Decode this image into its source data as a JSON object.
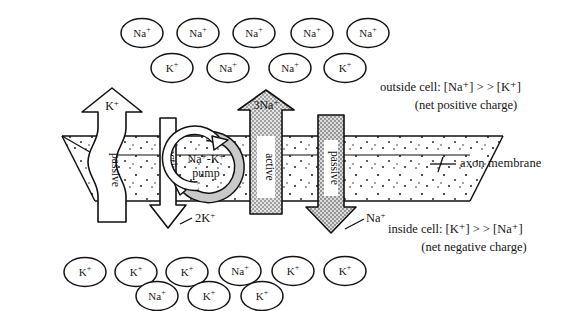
{
  "diagram": {
    "colors": {
      "stroke": "#111111",
      "membrane_fill": "#ffffff",
      "stipple": "#1a1a1a",
      "gray_arrow_fill": "#bdbdbd",
      "white_arrow_fill": "#ffffff",
      "text": "#141414"
    }
  },
  "outside": {
    "ions_row1": [
      {
        "label": "Na",
        "charge": "+",
        "x": 142,
        "y": 33
      },
      {
        "label": "Na",
        "charge": "+",
        "x": 198,
        "y": 33
      },
      {
        "label": "Na",
        "charge": "+",
        "x": 254,
        "y": 33
      },
      {
        "label": "Na",
        "charge": "+",
        "x": 312,
        "y": 33
      },
      {
        "label": "Na",
        "charge": "+",
        "x": 368,
        "y": 33
      }
    ],
    "ions_row2": [
      {
        "label": "K",
        "charge": "+",
        "x": 172,
        "y": 68
      },
      {
        "label": "Na",
        "charge": "+",
        "x": 228,
        "y": 68
      },
      {
        "label": "Na",
        "charge": "+",
        "x": 290,
        "y": 68
      },
      {
        "label": "K",
        "charge": "+",
        "x": 345,
        "y": 68
      }
    ],
    "caption_line1": "outside cell: [Na⁺] > > [K⁺]",
    "caption_line2": "(net positive charge)"
  },
  "inside": {
    "ions_row1": [
      {
        "label": "K",
        "charge": "+",
        "x": 85,
        "y": 272
      },
      {
        "label": "K",
        "charge": "+",
        "x": 136,
        "y": 272
      },
      {
        "label": "K",
        "charge": "+",
        "x": 187,
        "y": 272
      },
      {
        "label": "Na",
        "charge": "+",
        "x": 240,
        "y": 271
      },
      {
        "label": "K",
        "charge": "+",
        "x": 293,
        "y": 271
      },
      {
        "label": "K",
        "charge": "+",
        "x": 345,
        "y": 271
      }
    ],
    "ions_row2": [
      {
        "label": "Na",
        "charge": "+",
        "x": 157,
        "y": 296
      },
      {
        "label": "K",
        "charge": "+",
        "x": 209,
        "y": 296
      },
      {
        "label": "K",
        "charge": "+",
        "x": 262,
        "y": 296
      }
    ],
    "caption_line1": "inside cell: [K⁺] > > [Na⁺]",
    "caption_line2": "(net negative charge)"
  },
  "membrane": {
    "label": "axon membrane"
  },
  "channels": [
    {
      "id": "k-passive",
      "name": "potassium-passive-channel",
      "head_label": "K",
      "head_charge": "+",
      "shaft_label": "passive",
      "direction": "up",
      "fill": "white"
    },
    {
      "id": "k-active",
      "name": "potassium-active-channel",
      "foot_label": "2K",
      "foot_charge": "+",
      "shaft_label": "active",
      "direction": "down",
      "fill": "white"
    },
    {
      "id": "na-active",
      "name": "sodium-active-channel",
      "head_label": "3Na",
      "head_charge": "+",
      "shaft_label": "active",
      "direction": "up",
      "fill": "gray"
    },
    {
      "id": "na-passive",
      "name": "sodium-passive-channel",
      "foot_label": "Na",
      "foot_charge": "+",
      "shaft_label": "passive",
      "direction": "down",
      "fill": "gray"
    }
  ],
  "pump": {
    "line1": "Na⁺-K⁺",
    "line2": "pump"
  }
}
